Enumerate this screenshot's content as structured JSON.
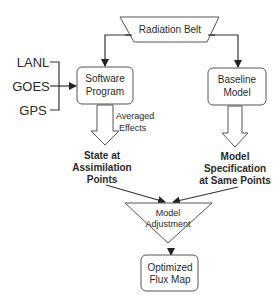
{
  "diagram": {
    "type": "flowchart",
    "colors": {
      "stroke": "#555555",
      "text": "#2a2a2a",
      "background": "#ffffff"
    },
    "nodes": {
      "radiation_belt": {
        "label": "Radiation Belt",
        "shape": "trapezoid"
      },
      "software_program": {
        "line1": "Software",
        "line2": "Program",
        "shape": "rounded-rect"
      },
      "baseline_model": {
        "line1": "Baseline",
        "line2": "Model",
        "shape": "rounded-rect"
      },
      "model_adjustment": {
        "line1": "Model",
        "line2": "Adjustment",
        "shape": "inverted-triangle"
      },
      "optimized_flux_map": {
        "line1": "Optimized",
        "line2": "Flux Map",
        "shape": "rounded-rect"
      }
    },
    "data_sources": [
      "LANL",
      "GOES",
      "GPS"
    ],
    "block_arrow_labels": {
      "left": {
        "line1": "Averaged",
        "line2": "Effects"
      }
    },
    "outputs": {
      "state": {
        "line1": "State at",
        "line2": "Assimilation",
        "line3": "Points"
      },
      "model_spec": {
        "line1": "Model",
        "line2": "Specification",
        "line3": "at Same Points"
      }
    },
    "edges": [
      {
        "from": "radiation_belt",
        "to": "software_program"
      },
      {
        "from": "radiation_belt",
        "to": "baseline_model"
      },
      {
        "from": "data_sources",
        "to": "software_program"
      },
      {
        "from": "software_program",
        "to": "state",
        "label": "Averaged Effects"
      },
      {
        "from": "baseline_model",
        "to": "model_spec"
      },
      {
        "from": "state",
        "to": "model_adjustment"
      },
      {
        "from": "model_spec",
        "to": "model_adjustment"
      },
      {
        "from": "model_adjustment",
        "to": "optimized_flux_map"
      }
    ]
  }
}
